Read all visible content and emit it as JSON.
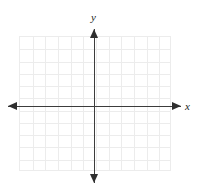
{
  "figure": {
    "type": "coordinate-plane",
    "title": ""
  },
  "axes": {
    "x": {
      "label": "x",
      "origin_px": 94,
      "start_px": 8,
      "end_px": 181,
      "y_px": 106,
      "arrow_start": "left",
      "arrow_end": "right",
      "color": "#3c3c3c"
    },
    "y": {
      "label": "y",
      "origin_px": 106,
      "start_px": 29,
      "end_px": 183,
      "x_px": 94,
      "arrow_start": "up",
      "arrow_end": "down",
      "color": "#3c3c3c"
    }
  },
  "grid": {
    "visible": true,
    "color": "#ececec",
    "left_px": 19,
    "top_px": 36,
    "width_px": 152,
    "height_px": 135,
    "columns": 12,
    "rows": 11,
    "cell_width_px": 12.67,
    "cell_height_px": 12.27
  },
  "chart_data": {
    "type": "line",
    "title": "",
    "xlabel": "x",
    "ylabel": "y",
    "series": [],
    "x": [],
    "values": [],
    "xlim": [
      -6,
      6
    ],
    "ylim": [
      -6,
      5
    ],
    "xticks": [
      -6,
      -5,
      -4,
      -3,
      -2,
      -1,
      0,
      1,
      2,
      3,
      4,
      5,
      6
    ],
    "yticks": [
      -6,
      -5,
      -4,
      -3,
      -2,
      -1,
      0,
      1,
      2,
      3,
      4,
      5
    ],
    "xticklabels": [
      "",
      "",
      "",
      "",
      "",
      "",
      "",
      "",
      "",
      "",
      "",
      "",
      ""
    ],
    "yticklabels": [
      "",
      "",
      "",
      "",
      "",
      "",
      "",
      "",
      "",
      "",
      "",
      ""
    ],
    "grid": true,
    "legend": null,
    "annotations": []
  }
}
